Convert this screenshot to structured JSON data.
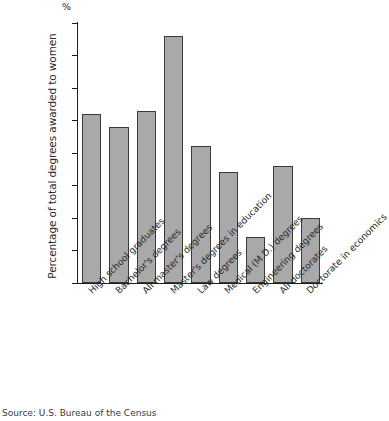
{
  "chart_data": {
    "type": "bar",
    "title": "",
    "subtitle": "",
    "xlabel": "",
    "ylabel": "Percentage of total degrees awarded to women",
    "unit_symbol": "%",
    "ylim": [
      0,
      80
    ],
    "ytick_step": 10,
    "yticks": [
      "80",
      "70",
      "60",
      "50",
      "40",
      "30",
      "20",
      "10",
      "0"
    ],
    "grid": false,
    "legend": null,
    "bar_color": "#a9a9a9",
    "bar_border_color": "#3a3a3a",
    "axis_color": "#1d1d1d",
    "categories": [
      "High school graduates",
      "Bachelor's degrees",
      "All master's degrees",
      "Master's degrees in education",
      "Law degrees",
      "Medical (M.D.) degrees",
      "Engineering degrees",
      "All doctorates",
      "Doctorate in economics"
    ],
    "values": [
      52,
      48,
      53,
      76,
      42,
      34,
      14,
      36,
      20
    ],
    "source": "Source: U.S. Bureau of the Census"
  }
}
